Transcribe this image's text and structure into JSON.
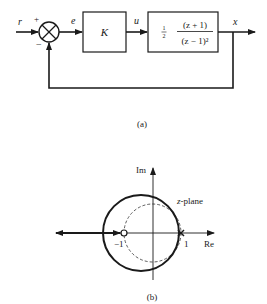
{
  "block_diagram": {
    "input_signal": "r",
    "plus_sign": "+",
    "minus_sign": "−",
    "error_signal": "e",
    "controller_gain": "K",
    "control_signal": "u",
    "plant": {
      "coefficient": "1/2",
      "coef_num": "1",
      "coef_den": "2",
      "numerator": "(z + 1)",
      "denominator": "(z − 1)²"
    },
    "output_signal": "x",
    "caption": "(a)"
  },
  "root_locus": {
    "imag_axis_label": "Im",
    "real_axis_label": "Re",
    "plane_label_italic": "z",
    "plane_label_rest": "-plane",
    "zero_label": "−1",
    "pole_label": "1",
    "caption": "(b)"
  }
}
